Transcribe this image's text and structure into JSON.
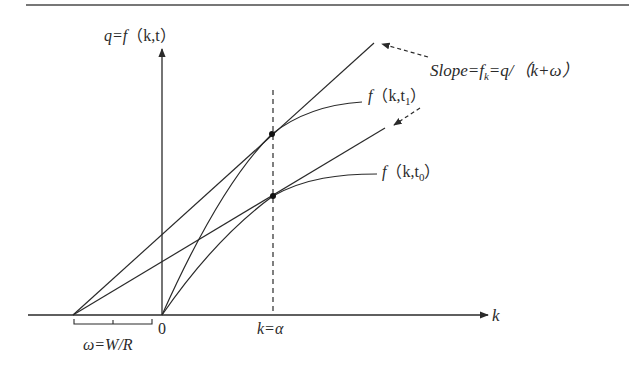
{
  "figure": {
    "type": "economics-diagram",
    "labels": {
      "y_axis_prefix": "q=f",
      "y_axis_args": "（k,t）",
      "x_axis": "k",
      "origin": "0",
      "alpha_mark": "k=α",
      "omega": "ω=W/R",
      "curve_t1_f": "f",
      "curve_t1_args_pre": "（k,t",
      "curve_t1_sub": "1",
      "curve_t1_close": "）",
      "curve_t0_f": "f",
      "curve_t0_args_pre": "（k,t",
      "curve_t0_sub": "0",
      "curve_t0_close": "）",
      "slope_pre": "Slope=f",
      "slope_sub": "k",
      "slope_post": "=q/（k+ω）"
    },
    "geometry": {
      "origin": [
        162,
        315
      ],
      "omega_point": [
        73,
        315
      ],
      "alpha_x": 273,
      "tangency_t1": [
        272,
        134
      ],
      "tangency_t0": [
        273,
        196
      ]
    },
    "colors": {
      "ink": "#2a2a2a",
      "rule": "#777777"
    }
  }
}
